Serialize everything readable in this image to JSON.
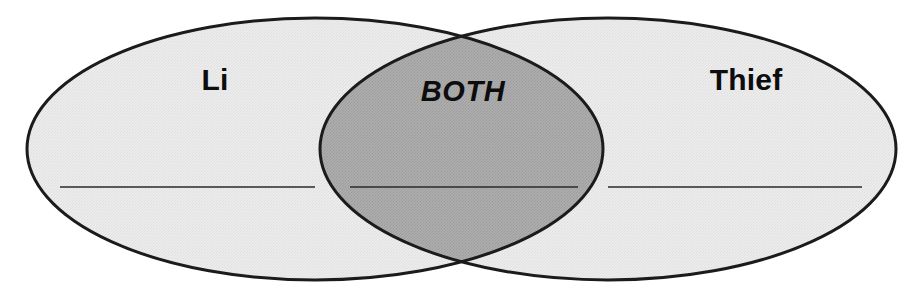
{
  "canvas": {
    "width": 913,
    "height": 291,
    "background_color": "#ffffff"
  },
  "diagram": {
    "type": "venn-2-set",
    "title": "",
    "outline_color": "#1b1b1b",
    "outline_width": 3,
    "set_fill_color": "#e8e8e8",
    "intersection_fill_color": "#a8a8a8",
    "line_color": "#2a2a2a",
    "sets": [
      {
        "id": "left",
        "label": "Li",
        "label_x": 215,
        "label_y": 90,
        "label_style": "bold",
        "cx": 315,
        "cy": 149,
        "rx": 288,
        "ry": 131,
        "fill": "#e8e8e8"
      },
      {
        "id": "right",
        "label": "Thief",
        "label_x": 746,
        "label_y": 90,
        "label_style": "bold",
        "cx": 608,
        "cy": 149,
        "rx": 288,
        "ry": 131,
        "fill": "#e8e8e8"
      }
    ],
    "intersection": {
      "id": "both",
      "label": "BOTH",
      "label_x": 463,
      "label_y": 101,
      "label_style": "bold-italic",
      "fill": "#a8a8a8"
    },
    "writing_lines": [
      {
        "id": "left-line",
        "x1": 60,
        "x2": 315,
        "y": 187
      },
      {
        "id": "center-line",
        "x1": 350,
        "x2": 578,
        "y": 187
      },
      {
        "id": "right-line",
        "x1": 608,
        "x2": 862,
        "y": 187
      }
    ]
  }
}
